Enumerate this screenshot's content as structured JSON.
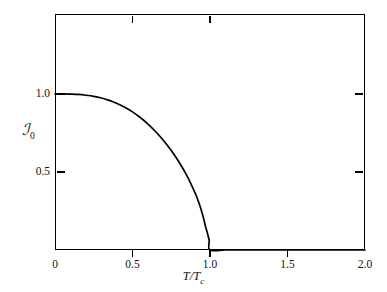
{
  "chart_data": {
    "type": "line",
    "title": "",
    "subtitle": "",
    "xlabel": "T/T_c",
    "ylabel": "A_0",
    "xlim": [
      0,
      2.0
    ],
    "ylim": [
      0,
      1.5125
    ],
    "grid": false,
    "legend": null,
    "x_ticks": [
      0,
      0.5,
      1.0,
      1.5,
      2.0
    ],
    "x_tick_labels": [
      "0",
      "0.5",
      "1.0",
      "1.5",
      "2.0"
    ],
    "y_ticks": [
      0.5,
      1.0
    ],
    "y_tick_labels": [
      "0.5",
      "1.0"
    ],
    "series": [
      {
        "name": "BCS energy gap",
        "x": [
          0.0,
          0.05,
          0.1,
          0.15,
          0.2,
          0.25,
          0.3,
          0.35,
          0.4,
          0.45,
          0.5,
          0.55,
          0.6,
          0.65,
          0.7,
          0.75,
          0.8,
          0.85,
          0.9,
          0.92,
          0.94,
          0.96,
          0.97,
          0.98,
          0.99,
          0.995,
          1.0,
          1.1,
          1.2,
          1.4,
          1.6,
          1.8,
          2.0
        ],
        "y": [
          1.0,
          1.0,
          0.999,
          0.997,
          0.992,
          0.985,
          0.974,
          0.959,
          0.939,
          0.915,
          0.885,
          0.849,
          0.807,
          0.758,
          0.702,
          0.638,
          0.564,
          0.478,
          0.374,
          0.325,
          0.268,
          0.198,
          0.154,
          0.12,
          0.082,
          0.058,
          0.0,
          0.0,
          0.0,
          0.0,
          0.0,
          0.0,
          0.0
        ]
      }
    ]
  },
  "axes": {
    "x_title_main": "T/T",
    "x_title_sub": "c",
    "y_title_main": "ℐ",
    "y_title_sub": "0"
  },
  "style": {
    "line_color": "#000000",
    "frame_color": "#000000",
    "background_color": "#ffffff",
    "text_color": "#111111"
  }
}
